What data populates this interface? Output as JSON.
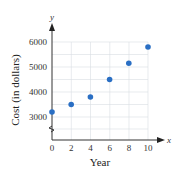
{
  "chart_data": {
    "type": "scatter",
    "title": "",
    "xlabel": "Year",
    "ylabel": "Cost (in dollars)",
    "x_axis_symbol": "x",
    "y_axis_symbol": "y",
    "x": [
      0,
      2,
      4,
      6,
      8,
      10
    ],
    "y": [
      3200,
      3500,
      3800,
      4500,
      5150,
      5800
    ],
    "x_ticks": [
      "0",
      "2",
      "4",
      "6",
      "8",
      "10"
    ],
    "y_ticks": [
      "3000",
      "4000",
      "5000",
      "6000"
    ],
    "xlim": [
      0,
      10
    ],
    "ylim": [
      2500,
      6000
    ],
    "axis_break_y": true,
    "grid": true,
    "point_color": "#2a6fc4"
  }
}
